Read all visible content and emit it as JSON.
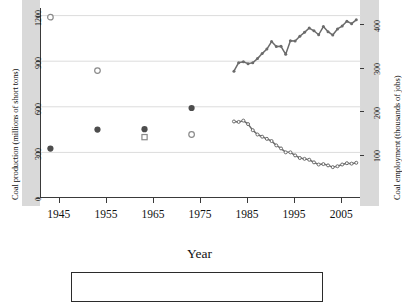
{
  "figure": {
    "xtitle": "Year",
    "left_axis_title": "Coal production (millions of short tons)",
    "right_axis_title": "Coal employment (thousands of jobs)",
    "left_ticks": [
      "0",
      "300",
      "600",
      "900",
      "1200"
    ],
    "right_ticks": [
      "100",
      "200",
      "300",
      "400"
    ],
    "x_ticks": [
      "1945",
      "1955",
      "1965",
      "1975",
      "1985",
      "1995",
      "2005"
    ],
    "legend_caption": ""
  },
  "colors": {
    "production_series": "#6b6b6b",
    "employment_series": "#6b6b6b",
    "marker_filled": "#4d4d4d",
    "marker_open": "#8a8a8a",
    "gridline": "#dcdcdc",
    "axis": "#3a3a3a",
    "margin_band": "#d9d9d9",
    "plot_background": "#ffffff"
  },
  "chart_data": {
    "type": "line",
    "title": "",
    "xlabel": "Year",
    "ylabel": "Coal production (millions of short tons)",
    "y2label": "Coal employment (thousands of jobs)",
    "xlim": [
      1941,
      2009
    ],
    "ylim": [
      0,
      1250
    ],
    "y2lim": [
      0,
      437
    ],
    "grid": true,
    "legend_position": "below-plot",
    "series": [
      {
        "name": "Coal production (millions of short tons)",
        "axis": "left",
        "style": "line",
        "marker": "filled-circle-small",
        "color": "#6b6b6b",
        "x": [
          1982,
          1983,
          1984,
          1985,
          1986,
          1987,
          1988,
          1989,
          1990,
          1991,
          1992,
          1993,
          1994,
          1995,
          1996,
          1997,
          1998,
          1999,
          2000,
          2001,
          2002,
          2003,
          2004,
          2005,
          2006,
          2007,
          2008
        ],
        "values": [
          834,
          890,
          896,
          884,
          890,
          917,
          950,
          980,
          1029,
          996,
          998,
          945,
          1034,
          1033,
          1064,
          1090,
          1118,
          1100,
          1074,
          1128,
          1094,
          1072,
          1112,
          1131,
          1163,
          1147,
          1172
        ]
      },
      {
        "name": "Coal employment (thousands of jobs)",
        "axis": "right",
        "style": "line",
        "marker": "open-circle-small",
        "color": "#6b6b6b",
        "x": [
          1982,
          1983,
          1984,
          1985,
          1986,
          1987,
          1988,
          1989,
          1990,
          1991,
          1992,
          1993,
          1994,
          1995,
          1996,
          1997,
          1998,
          1999,
          2000,
          2001,
          2002,
          2003,
          2004,
          2005,
          2006,
          2007,
          2008
        ],
        "values": [
          176,
          175,
          178,
          170,
          156,
          146,
          141,
          136,
          131,
          121,
          114,
          105,
          105,
          98,
          92,
          90,
          88,
          82,
          77,
          78,
          75,
          71,
          73,
          77,
          80,
          79,
          81
        ]
      },
      {
        "name": "Coal production (decadal points)",
        "axis": "left",
        "style": "points",
        "marker": "filled-circle",
        "color": "#4d4d4d",
        "x": [
          1943,
          1953,
          1963,
          1973
        ],
        "values": [
          325,
          450,
          453,
          592
        ]
      },
      {
        "name": "Coal employment (decadal points)",
        "axis": "right",
        "style": "points",
        "marker": "open",
        "color": "#8a8a8a",
        "x": [
          1943,
          1953,
          1963,
          1973
        ],
        "values": [
          416,
          293,
          140,
          146
        ]
      }
    ]
  }
}
